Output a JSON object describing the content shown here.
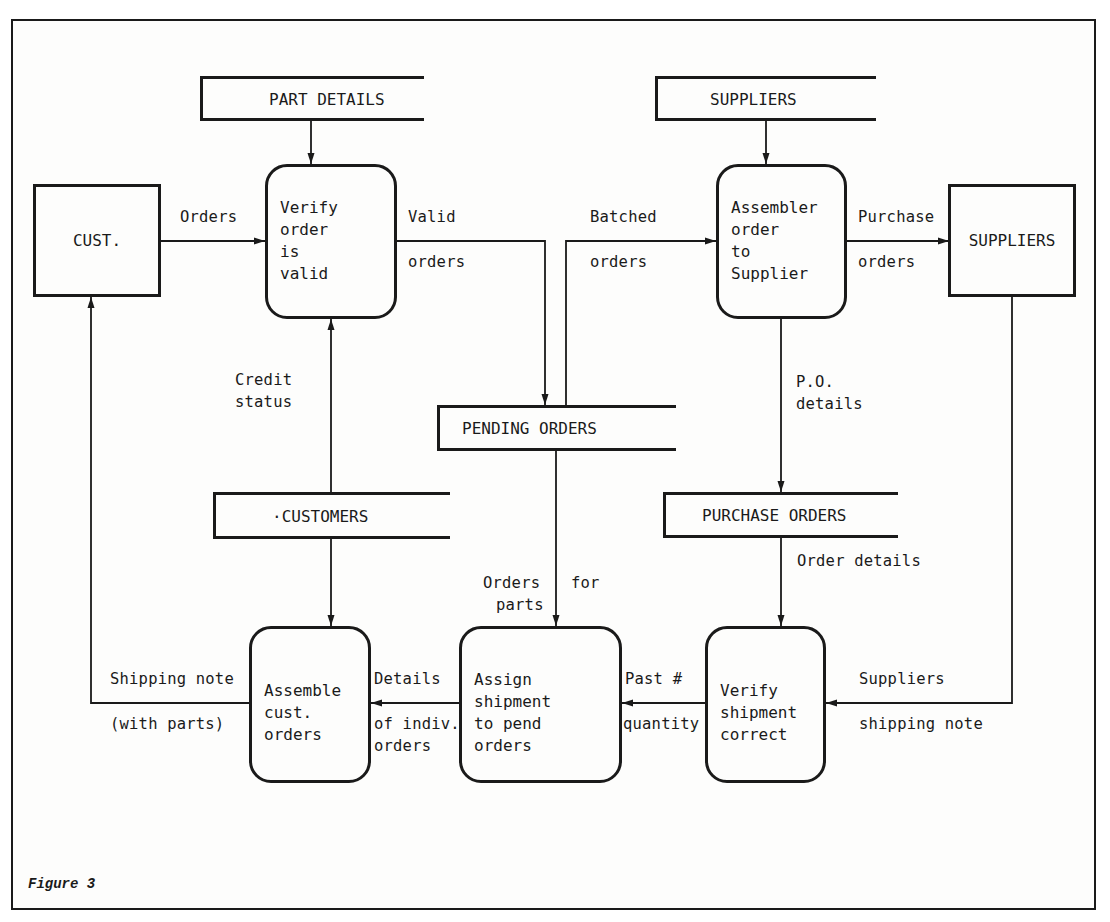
{
  "figure": {
    "caption": "Figure 3",
    "type": "data-flow-diagram"
  },
  "external_entities": {
    "customer": {
      "label": "CUST."
    },
    "suppliers": {
      "label": "SUPPLIERS"
    }
  },
  "processes": {
    "verify_order": {
      "lines": [
        "Verify",
        "order",
        "is",
        "valid"
      ],
      "text": "Verify\norder\nis\nvalid"
    },
    "assemble_supplier_order": {
      "lines": [
        "Assembler",
        "order",
        "to",
        "Supplier"
      ],
      "text": "Assembler\norder\nto\nSupplier"
    },
    "assemble_cust_orders": {
      "lines": [
        "Assemble",
        "cust.",
        "orders"
      ],
      "text": "Assemble\ncust.\norders"
    },
    "assign_shipment": {
      "lines": [
        "Assign",
        "shipment",
        "to pend",
        "orders"
      ],
      "text": "Assign\nshipment\nto pend\norders"
    },
    "verify_shipment": {
      "lines": [
        "Verify",
        "shipment",
        "correct"
      ],
      "text": "Verify\nshipment\ncorrect"
    }
  },
  "data_stores": {
    "part_details": {
      "label": "PART DETAILS"
    },
    "suppliers_store": {
      "label": "SUPPLIERS"
    },
    "pending_orders": {
      "label": "PENDING ORDERS"
    },
    "customers": {
      "label": "·CUSTOMERS"
    },
    "purchase_orders": {
      "label": "PURCHASE ORDERS"
    }
  },
  "flows": {
    "orders": {
      "label": "Orders"
    },
    "valid_orders": {
      "line1": "Valid",
      "line2": "orders"
    },
    "batched_orders": {
      "line1": "Batched",
      "line2": "orders"
    },
    "purchase_orders": {
      "line1": "Purchase",
      "line2": "orders"
    },
    "credit_status": {
      "line1": "Credit",
      "line2": "status"
    },
    "po_details": {
      "line1": "P.O.",
      "line2": "details"
    },
    "order_details": {
      "label": "Order details"
    },
    "orders_for_parts": {
      "line1a": "Orders",
      "line1b": "for",
      "line2": "parts"
    },
    "shipping_note": {
      "line1": "Shipping note",
      "line2": "(with parts)"
    },
    "details_indiv_orders": {
      "line1": "Details",
      "line2": "of indiv.",
      "line3": "orders"
    },
    "past_quantity": {
      "line1": "Past #",
      "line2": "quantity"
    },
    "suppliers_shipping_note": {
      "line1": "Suppliers",
      "line2": "shipping note"
    }
  },
  "colors": {
    "ink": "#1a1a1a",
    "paper": "#fdfdfc"
  }
}
